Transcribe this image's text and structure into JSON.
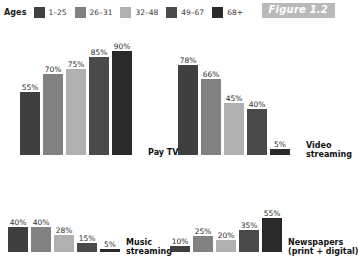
{
  "legend": {
    "title": "Ages",
    "items": [
      {
        "label": "1–25",
        "color": "#3f3f3f"
      },
      {
        "label": "26–31",
        "color": "#818181"
      },
      {
        "label": "32–48",
        "color": "#b0b0b0"
      },
      {
        "label": "49–67",
        "color": "#4a4a4a"
      },
      {
        "label": "68+",
        "color": "#2a2a2a"
      }
    ]
  },
  "figure_badge": {
    "label": "Figure 1.2",
    "background": "#b9b9b9",
    "text_color": "#ffffff"
  },
  "chart_data": [
    {
      "type": "bar",
      "title": "Pay TV",
      "categories": [
        "1–25",
        "26–31",
        "32–48",
        "49–67",
        "68+"
      ],
      "values": [
        55,
        70,
        75,
        85,
        90
      ],
      "value_labels": [
        "55%",
        "70%",
        "75%",
        "85%",
        "90%"
      ],
      "colors": [
        "#3f3f3f",
        "#818181",
        "#b0b0b0",
        "#4a4a4a",
        "#2a2a2a"
      ],
      "xlabel": "",
      "ylabel": "",
      "ylim": [
        0,
        100
      ],
      "grid": false,
      "legend_position": "top"
    },
    {
      "type": "bar",
      "title": "Video streaming",
      "categories": [
        "1–25",
        "26–31",
        "32–48",
        "49–67",
        "68+"
      ],
      "values": [
        78,
        66,
        45,
        40,
        5
      ],
      "value_labels": [
        "78%",
        "66%",
        "45%",
        "40%",
        "5%"
      ],
      "colors": [
        "#3f3f3f",
        "#818181",
        "#b0b0b0",
        "#4a4a4a",
        "#2a2a2a"
      ],
      "xlabel": "",
      "ylabel": "",
      "ylim": [
        0,
        100
      ],
      "grid": false,
      "legend_position": "top"
    },
    {
      "type": "bar",
      "title": "Music streaming",
      "categories": [
        "1–25",
        "26–31",
        "32–48",
        "49–67",
        "68+"
      ],
      "values": [
        40,
        40,
        28,
        15,
        5
      ],
      "value_labels": [
        "40%",
        "40%",
        "28%",
        "15%",
        "5%"
      ],
      "colors": [
        "#3f3f3f",
        "#818181",
        "#b0b0b0",
        "#4a4a4a",
        "#2a2a2a"
      ],
      "xlabel": "",
      "ylabel": "",
      "ylim": [
        0,
        100
      ],
      "grid": false,
      "legend_position": "top"
    },
    {
      "type": "bar",
      "title": "Newspapers (print + digital)",
      "title_line1": "Newspapers",
      "title_line2": "(print + digital)",
      "categories": [
        "1–25",
        "26–31",
        "32–48",
        "49–67",
        "68+"
      ],
      "values": [
        10,
        25,
        20,
        35,
        55
      ],
      "value_labels": [
        "10%",
        "25%",
        "20%",
        "35%",
        "55%"
      ],
      "colors": [
        "#3f3f3f",
        "#818181",
        "#b0b0b0",
        "#4a4a4a",
        "#2a2a2a"
      ],
      "xlabel": "",
      "ylabel": "",
      "ylim": [
        0,
        100
      ],
      "grid": false,
      "legend_position": "top"
    }
  ],
  "panel_labels": {
    "paytv_line1": "Pay TV",
    "paytv_line2": "",
    "video_line1": "Video",
    "video_line2": "streaming",
    "music_line1": "Music",
    "music_line2": "streaming",
    "news_line1": "Newspapers",
    "news_line2": "(print + digital)"
  }
}
